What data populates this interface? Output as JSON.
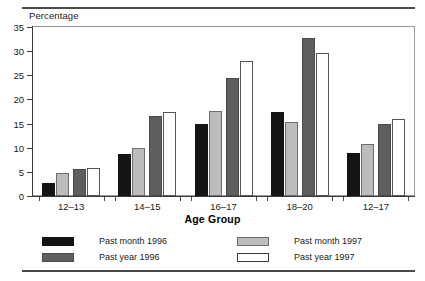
{
  "chart_data": {
    "type": "bar",
    "title": "",
    "subtitle": "",
    "xlabel": "Age Group",
    "ylabel": "Percentage",
    "categories": [
      "12–13",
      "14–15",
      "16–17",
      "18–20",
      "12–17"
    ],
    "series": [
      {
        "name": "Past month 1996",
        "color": "#141414",
        "values": [
          2.6,
          8.8,
          15.0,
          17.4,
          9.0
        ]
      },
      {
        "name": "Past month 1997",
        "color": "#bcbcbc",
        "values": [
          4.8,
          10.0,
          17.6,
          15.4,
          10.8
        ]
      },
      {
        "name": "Past year 1996",
        "color": "#5e5e5e",
        "values": [
          5.5,
          16.5,
          24.5,
          32.8,
          15.0
        ]
      },
      {
        "name": "Past year 1997",
        "color": "#ffffff",
        "values": [
          5.8,
          17.4,
          28.0,
          29.6,
          16.0
        ]
      }
    ],
    "ylim": [
      0,
      35
    ],
    "yticks": [
      0,
      5,
      10,
      15,
      20,
      25,
      30,
      35
    ],
    "ytick_labels": [
      "0",
      "5",
      "10",
      "15",
      "20",
      "25",
      "30",
      "35"
    ],
    "grid": false,
    "legend_position": "below-plot-two-columns",
    "legend_order": [
      "Past month 1996",
      "Past year 1996",
      "Past month 1997",
      "Past year 1997"
    ]
  },
  "axis": {
    "y_title": "Percentage",
    "x_title": "Age Group"
  },
  "legend": {
    "items": [
      {
        "label": "Past month 1996",
        "swatch": "black"
      },
      {
        "label": "Past year 1996",
        "swatch": "dark-gray"
      },
      {
        "label": "Past month 1997",
        "swatch": "light-gray"
      },
      {
        "label": "Past year 1997",
        "swatch": "white"
      }
    ]
  }
}
